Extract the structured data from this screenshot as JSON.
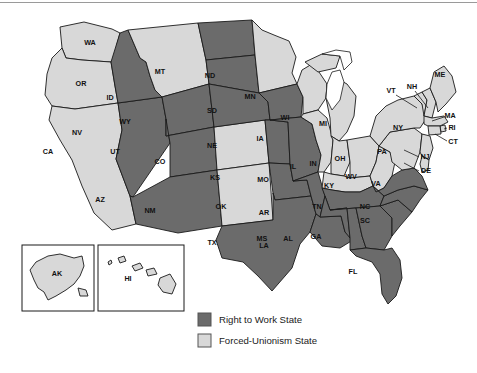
{
  "map": {
    "title": "Right to Work and Forced-Unionism States",
    "colors": {
      "right_to_work": "#6b6b6b",
      "forced_unionism": "#d8d8d8",
      "outline": "#1a1a1a",
      "water": "#ffffff",
      "background": "#ffffff"
    },
    "legend": {
      "items": [
        {
          "label": "Right to Work State",
          "color": "#6b6b6b",
          "key": "right_to_work"
        },
        {
          "label": "Forced-Unionism State",
          "color": "#d8d8d8",
          "key": "forced_unionism"
        }
      ]
    },
    "insets": [
      {
        "name": "alaska-inset",
        "label": "AK"
      },
      {
        "name": "hawaii-inset",
        "label": "HI"
      }
    ],
    "states": [
      {
        "code": "WA",
        "status": "forced_unionism",
        "leader": false
      },
      {
        "code": "OR",
        "status": "forced_unionism",
        "leader": false
      },
      {
        "code": "CA",
        "status": "forced_unionism",
        "leader": false
      },
      {
        "code": "NV",
        "status": "right_to_work",
        "leader": false
      },
      {
        "code": "ID",
        "status": "right_to_work",
        "leader": false
      },
      {
        "code": "MT",
        "status": "forced_unionism",
        "leader": false
      },
      {
        "code": "WY",
        "status": "right_to_work",
        "leader": false
      },
      {
        "code": "UT",
        "status": "right_to_work",
        "leader": false
      },
      {
        "code": "AZ",
        "status": "right_to_work",
        "leader": false
      },
      {
        "code": "CO",
        "status": "forced_unionism",
        "leader": false
      },
      {
        "code": "NM",
        "status": "forced_unionism",
        "leader": false
      },
      {
        "code": "ND",
        "status": "right_to_work",
        "leader": false
      },
      {
        "code": "SD",
        "status": "right_to_work",
        "leader": false
      },
      {
        "code": "NE",
        "status": "right_to_work",
        "leader": false
      },
      {
        "code": "KS",
        "status": "right_to_work",
        "leader": false
      },
      {
        "code": "OK",
        "status": "right_to_work",
        "leader": false
      },
      {
        "code": "TX",
        "status": "right_to_work",
        "leader": false
      },
      {
        "code": "MN",
        "status": "forced_unionism",
        "leader": false
      },
      {
        "code": "IA",
        "status": "right_to_work",
        "leader": false
      },
      {
        "code": "MO",
        "status": "right_to_work",
        "leader": false
      },
      {
        "code": "AR",
        "status": "right_to_work",
        "leader": false
      },
      {
        "code": "LA",
        "status": "right_to_work",
        "leader": false
      },
      {
        "code": "WI",
        "status": "forced_unionism",
        "leader": false
      },
      {
        "code": "IL",
        "status": "forced_unionism",
        "leader": false
      },
      {
        "code": "MI",
        "status": "forced_unionism",
        "leader": false
      },
      {
        "code": "IN",
        "status": "forced_unionism",
        "leader": false
      },
      {
        "code": "OH",
        "status": "forced_unionism",
        "leader": false
      },
      {
        "code": "KY",
        "status": "forced_unionism",
        "leader": false
      },
      {
        "code": "WV",
        "status": "forced_unionism",
        "leader": false
      },
      {
        "code": "TN",
        "status": "right_to_work",
        "leader": false
      },
      {
        "code": "MS",
        "status": "right_to_work",
        "leader": false
      },
      {
        "code": "AL",
        "status": "right_to_work",
        "leader": false
      },
      {
        "code": "GA",
        "status": "right_to_work",
        "leader": false
      },
      {
        "code": "FL",
        "status": "right_to_work",
        "leader": false
      },
      {
        "code": "SC",
        "status": "right_to_work",
        "leader": false
      },
      {
        "code": "NC",
        "status": "right_to_work",
        "leader": false
      },
      {
        "code": "VA",
        "status": "right_to_work",
        "leader": false
      },
      {
        "code": "PA",
        "status": "forced_unionism",
        "leader": false
      },
      {
        "code": "NY",
        "status": "forced_unionism",
        "leader": false
      },
      {
        "code": "VT",
        "status": "forced_unionism",
        "leader": true
      },
      {
        "code": "NH",
        "status": "forced_unionism",
        "leader": true
      },
      {
        "code": "ME",
        "status": "forced_unionism",
        "leader": false
      },
      {
        "code": "MA",
        "status": "forced_unionism",
        "leader": true
      },
      {
        "code": "RI",
        "status": "forced_unionism",
        "leader": true
      },
      {
        "code": "CT",
        "status": "forced_unionism",
        "leader": true
      },
      {
        "code": "NJ",
        "status": "forced_unionism",
        "leader": true
      },
      {
        "code": "DE",
        "status": "forced_unionism",
        "leader": true
      },
      {
        "code": "AK",
        "status": "forced_unionism",
        "leader": false
      },
      {
        "code": "HI",
        "status": "forced_unionism",
        "leader": false
      }
    ]
  }
}
